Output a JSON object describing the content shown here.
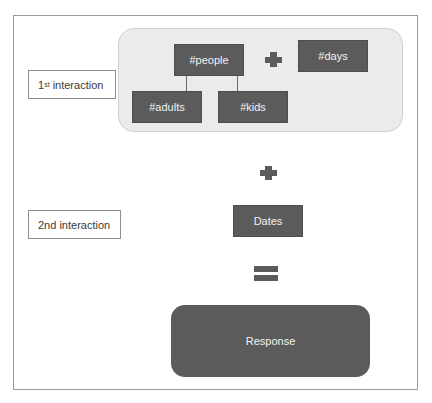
{
  "labels": {
    "first_interaction": {
      "prefix": "1",
      "superscript": "st",
      "suffix": " interaction"
    },
    "second_interaction": "2nd interaction"
  },
  "group": {
    "parent": "#people",
    "children": [
      "#adults",
      "#kids"
    ],
    "sibling": "#days"
  },
  "operators": {
    "plus_1": "plus-icon",
    "plus_2": "plus-icon",
    "equals": "equals-icon"
  },
  "dates_node": "Dates",
  "response_node": "Response",
  "colors": {
    "node_fill": "#5b5b5b",
    "node_text": "#f2f2f2",
    "group_fill": "#ebebeb",
    "frame_border": "#9a9a9a"
  }
}
